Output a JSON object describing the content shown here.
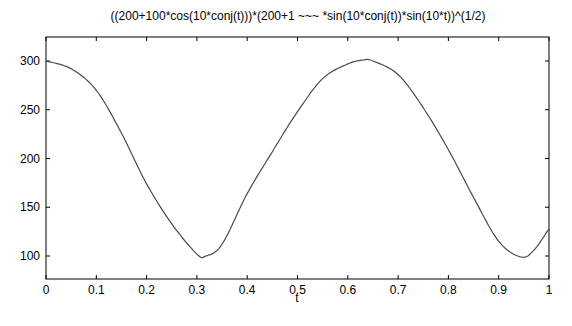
{
  "chart_data": {
    "type": "line",
    "title": "((200+100*cos(10*conj(t)))*(200+1 ~~~ *sin(10*conj(t))*sin(10*t))^(1/2)",
    "xlabel": "t",
    "ylabel": "",
    "xlim": [
      0,
      1
    ],
    "ylim": [
      76,
      325
    ],
    "grid": false,
    "legend": null,
    "x_ticks": [
      "0",
      "0.1",
      "0.2",
      "0.3",
      "0.4",
      "0.5",
      "0.6",
      "0.7",
      "0.8",
      "0.9",
      "1"
    ],
    "y_ticks": [
      "100",
      "150",
      "200",
      "250",
      "300"
    ],
    "series": [
      {
        "name": "f(t)",
        "color": "#4a4a4a",
        "x": [
          0,
          0.05,
          0.1,
          0.15,
          0.2,
          0.25,
          0.3,
          0.318,
          0.35,
          0.4,
          0.45,
          0.5,
          0.55,
          0.6,
          0.63,
          0.65,
          0.7,
          0.75,
          0.8,
          0.85,
          0.9,
          0.944,
          0.97,
          1.0
        ],
        "values": [
          300,
          292,
          270,
          226,
          174,
          133,
          102,
          100,
          112,
          164,
          207,
          248,
          282,
          297,
          301,
          300,
          286,
          252,
          209,
          160,
          115,
          99,
          106,
          128
        ]
      }
    ]
  }
}
